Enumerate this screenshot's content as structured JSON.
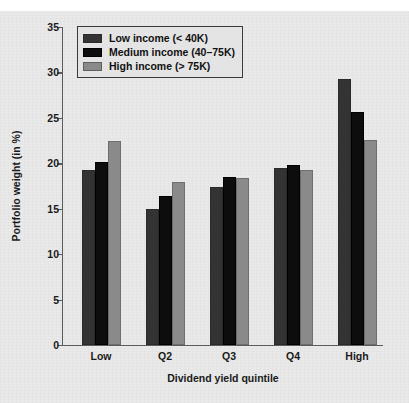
{
  "chart_data": {
    "type": "bar",
    "title": "",
    "xlabel": "Dividend yield quintile",
    "ylabel": "Portfolio weight (in %)",
    "categories": [
      "Low",
      "Q2",
      "Q3",
      "Q4",
      "High"
    ],
    "series": [
      {
        "name": "Low income (< 40K)",
        "color": "#333333",
        "values": [
          19.3,
          15.0,
          17.4,
          19.5,
          29.3
        ]
      },
      {
        "name": "Medium income (40–75K)",
        "color": "#0d0d0d",
        "values": [
          20.1,
          16.4,
          18.5,
          19.8,
          25.7
        ]
      },
      {
        "name": "High income (> 75K)",
        "color": "#8a8a8a",
        "values": [
          22.5,
          17.9,
          18.4,
          19.3,
          22.6
        ]
      }
    ],
    "ylim": [
      0,
      35
    ],
    "yticks": [
      0,
      5,
      10,
      15,
      20,
      25,
      30,
      35
    ],
    "ytick_labels": [
      "0",
      "5",
      "10",
      "15",
      "20",
      "25",
      "30",
      "35"
    ],
    "grid": false,
    "legend_position": "top-left",
    "background_color": "#e9e9e9",
    "axis_color": "#5a5a5a"
  },
  "legend": {
    "entries": [
      {
        "label": "Low income (< 40K)"
      },
      {
        "label": "Medium income (40–75K)"
      },
      {
        "label": "High income (> 75K)"
      }
    ]
  }
}
